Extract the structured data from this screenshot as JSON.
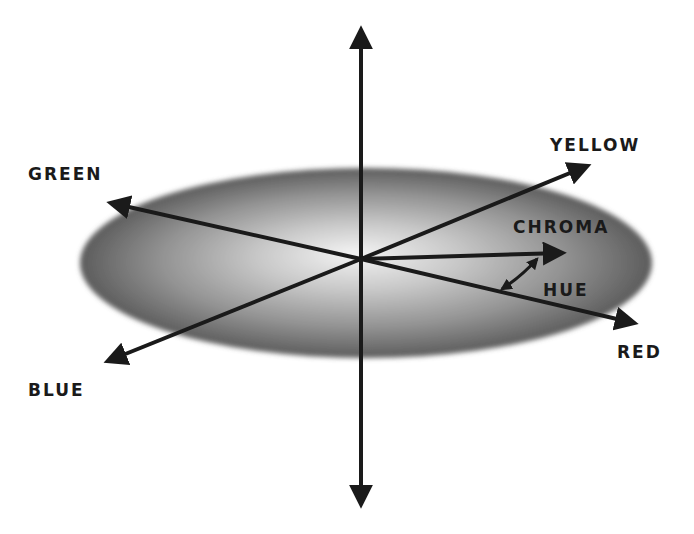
{
  "diagram": {
    "type": "color-space-axes",
    "colors": {
      "background": "#ffffff",
      "ink": "#1a1a1a",
      "disc_center": "#f2f2f2",
      "disc_mid": "#9a9a9a",
      "disc_edge": "#5a5a5a"
    },
    "labels": {
      "green": "GREEN",
      "yellow": "YELLOW",
      "chroma": "CHROMA",
      "hue": "HUE",
      "red": "RED",
      "blue": "BLUE"
    },
    "axes": [
      {
        "name": "vertical-axis",
        "from": [
          361,
          507
        ],
        "to": [
          361,
          27
        ],
        "double_headed": true
      },
      {
        "name": "green-red-axis",
        "from": [
          637,
          324
        ],
        "to": [
          108,
          203
        ],
        "double_headed": true
      },
      {
        "name": "blue-yellow-axis",
        "from": [
          105,
          362
        ],
        "to": [
          590,
          165
        ],
        "double_headed": true
      },
      {
        "name": "chroma-vector",
        "from": [
          361,
          259
        ],
        "to": [
          565,
          253
        ],
        "double_headed": false
      },
      {
        "name": "hue-arc",
        "from": [
          500,
          290
        ],
        "to": [
          538,
          258
        ],
        "double_headed": true
      }
    ],
    "disc": {
      "cx": 366,
      "cy": 263,
      "rx": 286,
      "ry": 95
    }
  }
}
